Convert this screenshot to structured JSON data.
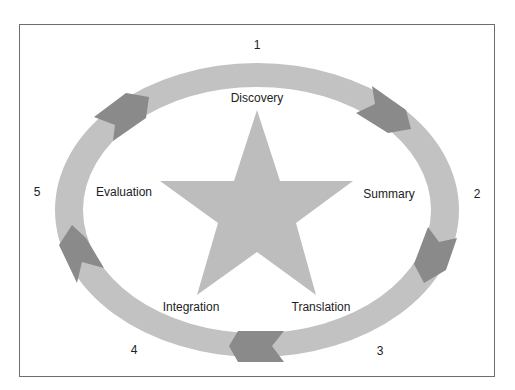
{
  "colors": {
    "ring": "#c2c2c2",
    "arrow": "#8a8a8a",
    "star": "#bdbdbd",
    "frame": "#6e6e6e",
    "text": "#222222"
  },
  "stages": [
    {
      "number": "1",
      "label": "Discovery"
    },
    {
      "number": "2",
      "label": "Summary"
    },
    {
      "number": "3",
      "label": "Translation"
    },
    {
      "number": "4",
      "label": "Integration"
    },
    {
      "number": "5",
      "label": "Evaluation"
    }
  ],
  "shapes": {
    "center": "star",
    "ring": "ellipse",
    "arrow_count": 5,
    "arrow_direction": "clockwise"
  }
}
